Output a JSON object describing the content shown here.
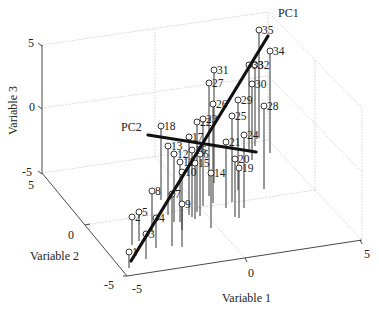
{
  "chart_data": {
    "type": "scatter",
    "subtype": "3d-stem-scatter",
    "title": "",
    "xlabel": "Variable 1",
    "ylabel": "Variable 2",
    "zlabel": "Variable 3",
    "xlim": [
      -5,
      5
    ],
    "ylim": [
      -5,
      5
    ],
    "zlim": [
      -5,
      5
    ],
    "x_ticks": [
      "-5",
      "0",
      "5"
    ],
    "y_ticks": [
      "-5",
      "0",
      "5"
    ],
    "z_ticks": [
      "-5",
      "0",
      "5"
    ],
    "grid": true,
    "lines": [
      {
        "name": "PC1",
        "label": "PC1",
        "description": "first principal component axis"
      },
      {
        "name": "PC2",
        "label": "PC2",
        "description": "second principal component axis"
      }
    ],
    "points": [
      {
        "id": "1",
        "screen": [
          129,
          252
        ],
        "stem_bottom": 268
      },
      {
        "id": "2",
        "screen": [
          132,
          217
        ],
        "stem_bottom": 245
      },
      {
        "id": "3",
        "screen": [
          146,
          234
        ],
        "stem_bottom": 259
      },
      {
        "id": "4",
        "screen": [
          156,
          218
        ],
        "stem_bottom": 248
      },
      {
        "id": "5",
        "screen": [
          139,
          212
        ],
        "stem_bottom": 241
      },
      {
        "id": "6",
        "screen": [
          200,
          154
        ],
        "stem_bottom": 216
      },
      {
        "id": "7",
        "screen": [
          172,
          194
        ],
        "stem_bottom": 246
      },
      {
        "id": "8",
        "screen": [
          152,
          191
        ],
        "stem_bottom": 232
      },
      {
        "id": "9",
        "screen": [
          182,
          204
        ],
        "stem_bottom": 247
      },
      {
        "id": "10",
        "screen": [
          182,
          172
        ],
        "stem_bottom": 230
      },
      {
        "id": "11",
        "screen": [
          180,
          162
        ],
        "stem_bottom": 222
      },
      {
        "id": "12",
        "screen": [
          174,
          154
        ],
        "stem_bottom": 222
      },
      {
        "id": "13",
        "screen": [
          168,
          146
        ],
        "stem_bottom": 215
      },
      {
        "id": "14",
        "screen": [
          211,
          173
        ],
        "stem_bottom": 228
      },
      {
        "id": "15",
        "screen": [
          195,
          163
        ],
        "stem_bottom": 219
      },
      {
        "id": "16",
        "screen": [
          192,
          150
        ],
        "stem_bottom": 217
      },
      {
        "id": "17",
        "screen": [
          189,
          137
        ],
        "stem_bottom": 215
      },
      {
        "id": "18",
        "screen": [
          161,
          126
        ],
        "stem_bottom": 200
      },
      {
        "id": "19",
        "screen": [
          239,
          168
        ],
        "stem_bottom": 218
      },
      {
        "id": "20",
        "screen": [
          235,
          159
        ],
        "stem_bottom": 217
      },
      {
        "id": "21",
        "screen": [
          226,
          142
        ],
        "stem_bottom": 208
      },
      {
        "id": "22",
        "screen": [
          197,
          122
        ],
        "stem_bottom": 212
      },
      {
        "id": "23",
        "screen": [
          203,
          119
        ],
        "stem_bottom": 206
      },
      {
        "id": "24",
        "screen": [
          244,
          135
        ],
        "stem_bottom": 208
      },
      {
        "id": "25",
        "screen": [
          232,
          116
        ],
        "stem_bottom": 202
      },
      {
        "id": "26",
        "screen": [
          213,
          104
        ],
        "stem_bottom": 203
      },
      {
        "id": "27",
        "screen": [
          209,
          83
        ],
        "stem_bottom": 196
      },
      {
        "id": "28",
        "screen": [
          264,
          106
        ],
        "stem_bottom": 189
      },
      {
        "id": "29",
        "screen": [
          238,
          100
        ],
        "stem_bottom": 190
      },
      {
        "id": "30",
        "screen": [
          252,
          84
        ],
        "stem_bottom": 160
      },
      {
        "id": "31",
        "screen": [
          214,
          70
        ],
        "stem_bottom": 183
      },
      {
        "id": "32",
        "screen": [
          255,
          65
        ],
        "stem_bottom": 146
      },
      {
        "id": "33",
        "screen": [
          249,
          65
        ],
        "stem_bottom": 150
      },
      {
        "id": "34",
        "screen": [
          270,
          51
        ],
        "stem_bottom": 153
      },
      {
        "id": "35",
        "screen": [
          259,
          30
        ],
        "stem_bottom": 138
      }
    ]
  },
  "axes": {
    "x": {
      "label": "Variable 1",
      "ticks": [
        "-5",
        "0",
        "5"
      ]
    },
    "y": {
      "label": "Variable 2",
      "ticks": [
        "-5",
        "0",
        "5"
      ]
    },
    "z": {
      "label": "Variable 3",
      "ticks": [
        "-5",
        "0",
        "5"
      ]
    }
  },
  "annotations": {
    "pc1": "PC1",
    "pc2": "PC2"
  }
}
